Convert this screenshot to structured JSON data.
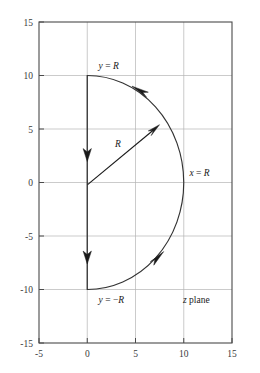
{
  "chart_data": {
    "type": "line",
    "title": "",
    "xlabel": "",
    "ylabel": "",
    "xlim": [
      -5,
      15
    ],
    "ylim": [
      -15,
      15
    ],
    "xticks": [
      -5,
      0,
      5,
      10,
      15
    ],
    "yticks": [
      -15,
      -10,
      -5,
      0,
      5,
      10,
      15
    ],
    "xtick_labels": [
      "-5",
      "0",
      "5",
      "10",
      "15"
    ],
    "ytick_labels": [
      "-15",
      "-10",
      "-5",
      "0",
      "5",
      "10",
      "15"
    ],
    "grid": true,
    "grid_color": "#b4b4b4",
    "frame_color": "#4a4a4a",
    "curve_color": "#333333",
    "series": [
      {
        "name": "vertical-segment",
        "description": "Straight line from (0, 10) down to (0, -10) with downward direction arrows",
        "x": [
          0,
          0
        ],
        "y": [
          10,
          -10
        ],
        "direction": "downward",
        "arrow_positions": [
          [
            0,
            2.6
          ],
          [
            0,
            -7.0
          ]
        ]
      },
      {
        "name": "semicircular-arc",
        "description": "Semicircle of radius 10 centred at the origin spanning the right half plane, traversed counterclockwise from (0, -10) through (10, 0) to (0, 10)",
        "radius": 10,
        "center": [
          0,
          0
        ],
        "start_point": [
          0,
          -10
        ],
        "end_point": [
          0,
          10
        ],
        "rightmost_point": [
          10,
          0
        ],
        "direction": "counterclockwise",
        "arrow_positions": [
          [
            7.5,
            -6.6
          ],
          [
            5.4,
            8.4
          ]
        ]
      },
      {
        "name": "radius-arrow",
        "description": "Arrow from the origin pointing outward to the arc, labelled R",
        "x": [
          0,
          7.2
        ],
        "y": [
          0,
          5.3
        ],
        "direction": "outward"
      }
    ],
    "annotations": [
      {
        "id": "label-y-equals-R",
        "text": "y = R",
        "italic_parts": [
          "y",
          "R"
        ],
        "x": 1.2,
        "y": 11.0,
        "anchor": "start"
      },
      {
        "id": "label-y-equals-minusR",
        "text": "y = −R",
        "italic_parts": [
          "y",
          "R"
        ],
        "x": 1.2,
        "y": -11.6,
        "anchor": "start"
      },
      {
        "id": "label-x-equals-R",
        "text": "x = R",
        "italic_parts": [
          "x",
          "R"
        ],
        "x": 10.6,
        "y": 0.9,
        "anchor": "start"
      },
      {
        "id": "label-radius-R",
        "text": "R",
        "italic_parts": [
          "R"
        ],
        "x": 3.2,
        "y": 3.6,
        "anchor": "middle"
      },
      {
        "id": "label-z-plane",
        "text": "z plane",
        "italic_parts": [
          "z"
        ],
        "x": 9.9,
        "y": -11.6,
        "anchor": "start"
      }
    ]
  }
}
